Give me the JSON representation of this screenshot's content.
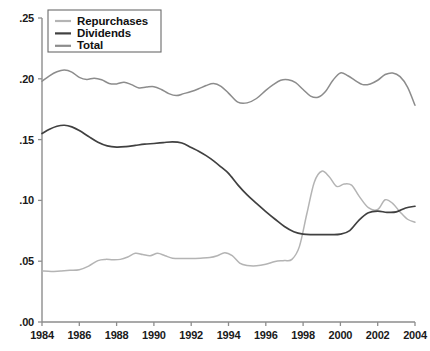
{
  "chart_data": {
    "type": "line",
    "title": "",
    "subtitle": "",
    "xlabel": "",
    "ylabel": "",
    "xlim": [
      1984,
      2004
    ],
    "ylim": [
      0.0,
      0.25
    ],
    "grid": false,
    "legend_position": "top-left",
    "x_ticks": [
      1984,
      1986,
      1988,
      1990,
      1992,
      1994,
      1996,
      1998,
      2000,
      2002,
      2004
    ],
    "x_tick_labels": [
      "1984",
      "1986",
      "1988",
      "1990",
      "1992",
      "1994",
      "1996",
      "1998",
      "2000",
      "2002",
      "2004"
    ],
    "y_ticks": [
      0.0,
      0.05,
      0.1,
      0.15,
      0.2,
      0.25
    ],
    "y_tick_labels": [
      ".00",
      ".05",
      ".10",
      ".15",
      ".20",
      ".25"
    ],
    "series": [
      {
        "name": "Repurchases",
        "color": "#b4b4b4",
        "width": 1.5,
        "x": [
          1984,
          1984.5,
          1985,
          1985.5,
          1986,
          1986.5,
          1987,
          1987.4,
          1987.8,
          1988.2,
          1988.6,
          1989,
          1989.4,
          1989.8,
          1990.2,
          1990.6,
          1991,
          1991.5,
          1992,
          1992.5,
          1993,
          1993.4,
          1993.8,
          1994.2,
          1994.6,
          1995,
          1995.5,
          1996,
          1996.5,
          1997,
          1997.4,
          1997.8,
          1998.2,
          1998.6,
          1999,
          1999.4,
          1999.8,
          2000.2,
          2000.6,
          2001,
          2001.5,
          2002,
          2002.4,
          2002.8,
          2003.2,
          2003.6,
          2004
        ],
        "values": [
          0.042,
          0.0415,
          0.042,
          0.0425,
          0.043,
          0.046,
          0.0505,
          0.0515,
          0.0512,
          0.0515,
          0.0535,
          0.0565,
          0.0555,
          0.0545,
          0.0565,
          0.0545,
          0.0525,
          0.0522,
          0.0522,
          0.0525,
          0.053,
          0.0545,
          0.057,
          0.0545,
          0.0485,
          0.0465,
          0.0462,
          0.0475,
          0.0498,
          0.0505,
          0.0515,
          0.062,
          0.089,
          0.115,
          0.124,
          0.1195,
          0.1115,
          0.1135,
          0.1125,
          0.1035,
          0.094,
          0.0925,
          0.1005,
          0.0975,
          0.0905,
          0.0845,
          0.082
        ]
      },
      {
        "name": "Dividends",
        "color": "#404040",
        "width": 1.7,
        "x": [
          1984,
          1984.4,
          1984.8,
          1985.2,
          1985.6,
          1986,
          1986.5,
          1987,
          1987.5,
          1988,
          1988.5,
          1989,
          1989.5,
          1990,
          1990.5,
          1991,
          1991.5,
          1992,
          1992.4,
          1992.8,
          1993.2,
          1993.6,
          1994,
          1994.5,
          1995,
          1995.5,
          1996,
          1996.5,
          1997,
          1997.5,
          1998,
          1998.5,
          1999,
          1999.5,
          2000,
          2000.5,
          2001,
          2001.5,
          2002,
          2002.5,
          2003,
          2003.5,
          2004
        ],
        "values": [
          0.155,
          0.1585,
          0.161,
          0.1618,
          0.1605,
          0.1575,
          0.1525,
          0.1478,
          0.1448,
          0.1438,
          0.1442,
          0.1452,
          0.1462,
          0.1468,
          0.1475,
          0.1482,
          0.1472,
          0.1435,
          0.1405,
          0.1368,
          0.1325,
          0.1275,
          0.1222,
          0.1128,
          0.1045,
          0.0975,
          0.0908,
          0.0845,
          0.0785,
          0.0742,
          0.0722,
          0.0718,
          0.0718,
          0.0718,
          0.0722,
          0.0752,
          0.0838,
          0.0898,
          0.0912,
          0.0902,
          0.0905,
          0.0938,
          0.0952
        ]
      },
      {
        "name": "Total",
        "color": "#8c8c8c",
        "width": 1.5,
        "x": [
          1984,
          1984.4,
          1984.8,
          1985.2,
          1985.6,
          1986,
          1986.4,
          1986.8,
          1987.2,
          1987.6,
          1988,
          1988.4,
          1988.8,
          1989.2,
          1989.6,
          1990,
          1990.4,
          1990.8,
          1991.2,
          1991.6,
          1992,
          1992.4,
          1992.8,
          1993.2,
          1993.6,
          1994,
          1994.5,
          1995,
          1995.5,
          1996,
          1996.4,
          1996.8,
          1997.2,
          1997.6,
          1998,
          1998.4,
          1998.8,
          1999.2,
          1999.6,
          2000,
          2000.4,
          2000.8,
          2001.2,
          2001.6,
          2002,
          2002.4,
          2002.8,
          2003.2,
          2003.6,
          2004
        ],
        "values": [
          0.198,
          0.2025,
          0.2058,
          0.2072,
          0.2055,
          0.2012,
          0.1995,
          0.2005,
          0.1992,
          0.1962,
          0.1958,
          0.1972,
          0.1952,
          0.1925,
          0.1932,
          0.1935,
          0.1912,
          0.1878,
          0.1862,
          0.1878,
          0.1895,
          0.1918,
          0.1945,
          0.1962,
          0.1938,
          0.1882,
          0.1808,
          0.1802,
          0.1838,
          0.1905,
          0.1952,
          0.1988,
          0.1992,
          0.1968,
          0.1912,
          0.1858,
          0.1848,
          0.1895,
          0.1988,
          0.2048,
          0.2025,
          0.1985,
          0.1952,
          0.1958,
          0.1988,
          0.2035,
          0.2048,
          0.2018,
          0.1932,
          0.1782
        ]
      }
    ]
  },
  "legend": {
    "items": [
      {
        "label": "Repurchases",
        "color": "#b4b4b4"
      },
      {
        "label": "Dividends",
        "color": "#404040"
      },
      {
        "label": "Total",
        "color": "#8c8c8c"
      }
    ]
  },
  "axes": {
    "axis_color": "#8d8d8d"
  }
}
